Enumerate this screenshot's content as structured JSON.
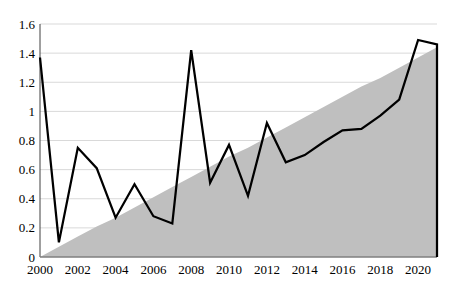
{
  "chart_data": {
    "type": "line",
    "title": "",
    "xlabel": "",
    "ylabel": "",
    "legend": "none",
    "grid": true,
    "x": [
      2000,
      2001,
      2002,
      2003,
      2004,
      2005,
      2006,
      2007,
      2008,
      2009,
      2010,
      2011,
      2012,
      2013,
      2014,
      2015,
      2016,
      2017,
      2018,
      2019,
      2020,
      2021
    ],
    "series": [
      {
        "name": "ramp-area",
        "type": "area",
        "color": "#bfbfbf",
        "description": "gray triangle rising linearly from 0 in 2000 to 1.44 in 2021",
        "values": [
          0,
          0.07,
          0.14,
          0.21,
          0.27,
          0.34,
          0.41,
          0.48,
          0.55,
          0.62,
          0.69,
          0.75,
          0.82,
          0.89,
          0.96,
          1.03,
          1.1,
          1.17,
          1.23,
          1.3,
          1.37,
          1.44
        ]
      },
      {
        "name": "volatile-line",
        "type": "line",
        "color": "#000000",
        "drop_to_zero_at_end": true,
        "values": [
          1.37,
          0.1,
          0.75,
          0.61,
          0.27,
          0.5,
          0.28,
          0.23,
          1.42,
          0.51,
          0.77,
          0.42,
          0.92,
          0.65,
          0.7,
          0.79,
          0.87,
          0.88,
          0.97,
          1.08,
          1.49,
          1.46
        ]
      }
    ],
    "xlim": [
      2000,
      2021
    ],
    "ylim": [
      0,
      1.6
    ],
    "ytick_step": 0.2,
    "ytick_labels": [
      "0",
      "0.2",
      "0.4",
      "0.6",
      "0.8",
      "1",
      "1.2",
      "1.4",
      "1.6"
    ],
    "xtick_labels": [
      "2000",
      "2002",
      "2004",
      "2006",
      "2008",
      "2010",
      "2012",
      "2014",
      "2016",
      "2018",
      "2020"
    ],
    "colors": {
      "background": "#ffffff",
      "line": "#000000",
      "area_fill": "#bfbfbf",
      "gridline": "#d9d9d9",
      "y_axis": "#404040",
      "x_axis": "#7f7f7f",
      "tick_text": "#000000"
    }
  }
}
